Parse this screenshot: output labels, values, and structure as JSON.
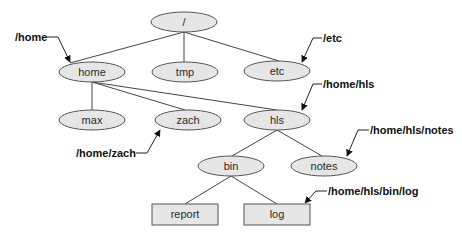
{
  "diagram": {
    "title": "",
    "colors": {
      "node_fill": "#e6e6e6",
      "node_stroke": "#555555",
      "edge": "#444444",
      "text": "#2a2a2a",
      "callout_text": "#111111"
    },
    "nodes": [
      {
        "id": "root",
        "label": "/",
        "shape": "ellipse",
        "cx": 184,
        "cy": 22,
        "rx": 33,
        "ry": 10
      },
      {
        "id": "home",
        "label": "home",
        "shape": "ellipse",
        "cx": 92,
        "cy": 72,
        "rx": 33,
        "ry": 10
      },
      {
        "id": "tmp",
        "label": "tmp",
        "shape": "ellipse",
        "cx": 185,
        "cy": 72,
        "rx": 33,
        "ry": 10
      },
      {
        "id": "etc",
        "label": "etc",
        "shape": "ellipse",
        "cx": 277,
        "cy": 71,
        "rx": 33,
        "ry": 10
      },
      {
        "id": "max",
        "label": "max",
        "shape": "ellipse",
        "cx": 92,
        "cy": 120,
        "rx": 33,
        "ry": 10
      },
      {
        "id": "zach",
        "label": "zach",
        "shape": "ellipse",
        "cx": 188,
        "cy": 120,
        "rx": 33,
        "ry": 10
      },
      {
        "id": "hls",
        "label": "hls",
        "shape": "ellipse",
        "cx": 277,
        "cy": 120,
        "rx": 33,
        "ry": 10
      },
      {
        "id": "bin",
        "label": "bin",
        "shape": "ellipse",
        "cx": 231,
        "cy": 166,
        "rx": 33,
        "ry": 10
      },
      {
        "id": "notes",
        "label": "notes",
        "shape": "ellipse",
        "cx": 324,
        "cy": 166,
        "rx": 33,
        "ry": 10
      },
      {
        "id": "report",
        "label": "report",
        "shape": "rect",
        "x": 152,
        "y": 204,
        "w": 66,
        "h": 21
      },
      {
        "id": "log",
        "label": "log",
        "shape": "rect",
        "x": 244,
        "y": 204,
        "w": 66,
        "h": 21
      }
    ],
    "edges": [
      {
        "from": "root",
        "to": "home"
      },
      {
        "from": "root",
        "to": "tmp"
      },
      {
        "from": "root",
        "to": "etc"
      },
      {
        "from": "home",
        "to": "max"
      },
      {
        "from": "home",
        "to": "zach"
      },
      {
        "from": "home",
        "to": "hls"
      },
      {
        "from": "hls",
        "to": "bin"
      },
      {
        "from": "hls",
        "to": "notes"
      },
      {
        "from": "bin",
        "to": "report"
      },
      {
        "from": "bin",
        "to": "log"
      }
    ],
    "callouts": [
      {
        "id": "callout-home",
        "text": "/home",
        "target": "home"
      },
      {
        "id": "callout-etc",
        "text": "/etc",
        "target": "etc"
      },
      {
        "id": "callout-hls",
        "text": "/home/hls",
        "target": "hls"
      },
      {
        "id": "callout-zach",
        "text": "/home/zach",
        "target": "zach"
      },
      {
        "id": "callout-notes",
        "text": "/home/hls/notes",
        "target": "notes"
      },
      {
        "id": "callout-log",
        "text": "/home/hls/bin/log",
        "target": "log"
      }
    ]
  }
}
